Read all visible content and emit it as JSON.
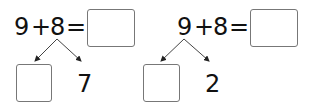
{
  "problems": [
    {
      "equation": {
        "a": "9",
        "op": "+",
        "b": "8",
        "eq": "="
      },
      "split_target": "8",
      "branches": {
        "left": "",
        "right": "7"
      },
      "answer": ""
    },
    {
      "equation": {
        "a": "9",
        "op": "+",
        "b": "8",
        "eq": "="
      },
      "split_target": "9",
      "branches": {
        "left": "",
        "right": "2"
      },
      "answer": ""
    }
  ]
}
